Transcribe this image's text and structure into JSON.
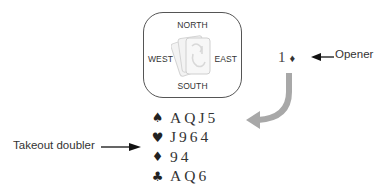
{
  "table": {
    "north": "NORTH",
    "south": "SOUTH",
    "west": "WEST",
    "east": "EAST",
    "center_icon": "cards-icon"
  },
  "bid": {
    "level": "1",
    "suit_symbol": "♦",
    "suit": "diamonds"
  },
  "labels": {
    "opener": "Opener",
    "takeout_doubler": "Takeout doubler"
  },
  "hand": [
    {
      "suit": "spades",
      "symbol": "♠",
      "cards": "AQJ5"
    },
    {
      "suit": "hearts",
      "symbol": "♥",
      "cards": "J964"
    },
    {
      "suit": "diamonds",
      "symbol": "♦",
      "cards": "94"
    },
    {
      "suit": "clubs",
      "symbol": "♣",
      "cards": "AQ6"
    }
  ],
  "colors": {
    "border": "#555555",
    "text": "#333333",
    "curve_arrow": "#a8a8a8",
    "arrow": "#111111"
  }
}
